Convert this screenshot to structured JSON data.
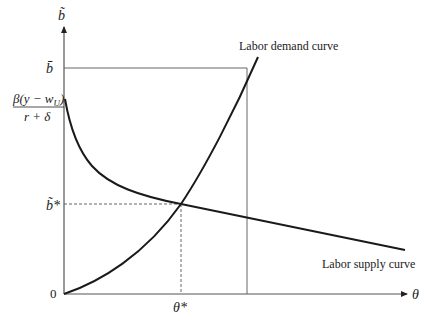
{
  "diagram": {
    "title": "",
    "axes": {
      "x_label": "θ",
      "y_label": "b̃",
      "origin_label": "0"
    },
    "y_ticks": {
      "b_bar": "b̄",
      "intercept_numerator": "β(y − w",
      "intercept_subscript": "U",
      "intercept_numerator_close": ")",
      "intercept_denominator": "r + δ",
      "b_star": "b̃*"
    },
    "x_ticks": {
      "theta_star": "θ*"
    },
    "curves": [
      {
        "name": "Labor demand curve",
        "shape": "increasing convex from origin"
      },
      {
        "name": "Labor supply curve",
        "shape": "decreasing convex from intercept"
      }
    ],
    "labels": {
      "demand": "Labor demand curve",
      "supply": "Labor supply curve"
    },
    "colors": {
      "curve": "#1a1a1a",
      "axis": "#555555",
      "guide": "#666666"
    }
  }
}
